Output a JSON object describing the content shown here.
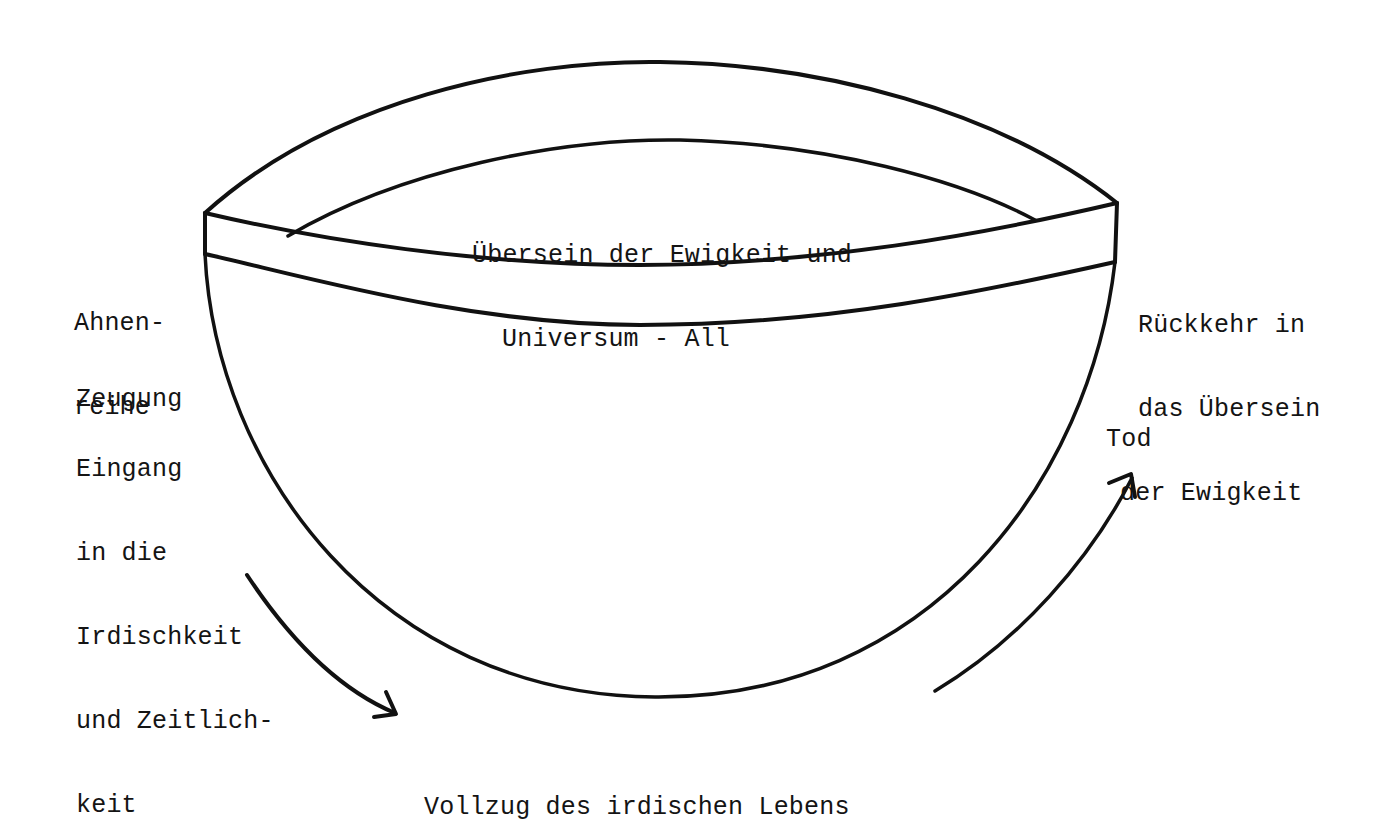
{
  "diagram": {
    "title_region": {
      "line1": "Übersein der Ewigkeit und",
      "line2": "Universum - All"
    },
    "left_labels": {
      "ahnenreihe": [
        "Ahnen-",
        "reihe"
      ],
      "zeugung": "Zeugung",
      "eingang": [
        "Eingang",
        "in die",
        "Irdischkeit",
        "und Zeitlich-",
        "keit"
      ]
    },
    "right_labels": {
      "rueckkehr": [
        "Rückkehr in",
        "das Übersein",
        "der Ewigkeit"
      ],
      "tod": "Tod"
    },
    "bottom_label": "Vollzug des irdischen Lebens",
    "colors": {
      "ink": "#111111",
      "background": "#ffffff"
    }
  }
}
